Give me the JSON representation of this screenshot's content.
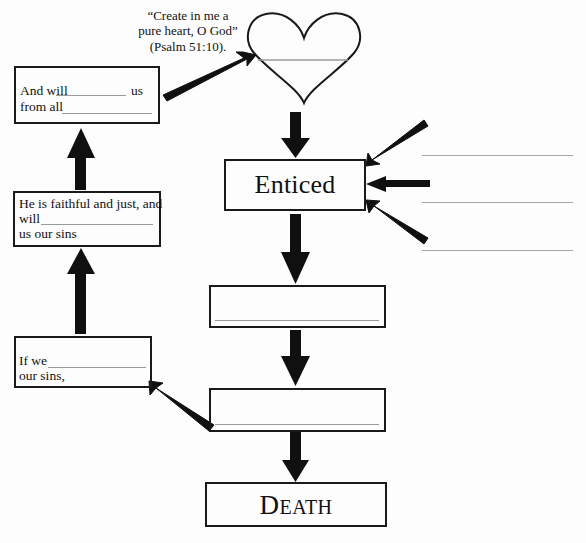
{
  "worksheet": {
    "scripture_quote": {
      "line1": "“Create in me a",
      "line2": "pure heart, O God”",
      "line3": "(Psalm 51:10)."
    },
    "heart_node": {
      "name": "heart-shape",
      "blank_label": ""
    },
    "center_boxes": [
      {
        "id": "enticed",
        "label": "Enticed",
        "has_blank_line": false
      },
      {
        "id": "center-blank-1",
        "label": "",
        "has_blank_line": true
      },
      {
        "id": "center-blank-2",
        "label": "",
        "has_blank_line": true
      },
      {
        "id": "death",
        "label": "DEATH",
        "label_caps": "D",
        "label_rest": "EATH",
        "has_blank_line": false
      }
    ],
    "left_boxes": [
      {
        "id": "forgive-cleanse",
        "line1_pre": "And will",
        "line1_post": "us",
        "line2_pre": "from all",
        "line2_post": ""
      },
      {
        "id": "faithful-just",
        "line1": "He is faithful and just, and",
        "line2_pre": "will",
        "line3": "us our sins"
      },
      {
        "id": "if-we-confess",
        "line1_pre": "If we",
        "line2": "our sins,"
      }
    ],
    "right_blank_lines": [
      {
        "id": "right-line-1",
        "text": ""
      },
      {
        "id": "right-line-2",
        "text": ""
      },
      {
        "id": "right-line-3",
        "text": ""
      }
    ],
    "colors": {
      "ink": "#1a1a1a",
      "blank_rule": "#9a9a9a",
      "page_background": "#fdfdfd"
    }
  }
}
